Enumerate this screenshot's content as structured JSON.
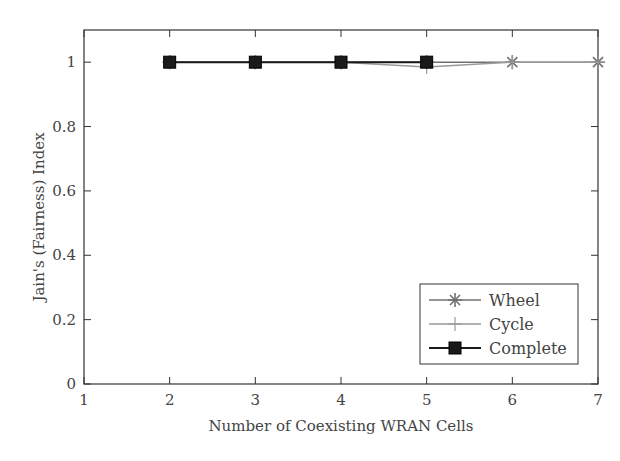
{
  "chart_data": {
    "type": "line",
    "title": "",
    "xlabel": "Number of Coexisting WRAN Cells",
    "ylabel": "Jain's (Fairness) Index",
    "xlim": [
      1,
      7
    ],
    "ylim": [
      0,
      1.1
    ],
    "xticks": [
      1,
      2,
      3,
      4,
      5,
      6,
      7
    ],
    "yticks": [
      0,
      0.2,
      0.4,
      0.6,
      0.8,
      1
    ],
    "ytick_labels": [
      "0",
      "0.2",
      "0.4",
      "0.6",
      "0.8",
      "1"
    ],
    "grid": false,
    "legend_position": "lower right",
    "series": [
      {
        "name": "Wheel",
        "marker": "asterisk",
        "color": "#707070",
        "x": [
          2,
          3,
          4,
          5,
          6,
          7
        ],
        "values": [
          1.0,
          1.0,
          1.0,
          1.0,
          1.0,
          1.0
        ]
      },
      {
        "name": "Cycle",
        "marker": "plus",
        "color": "#9a9a9a",
        "x": [
          2,
          3,
          4,
          5,
          6,
          7
        ],
        "values": [
          1.0,
          1.0,
          1.0,
          0.985,
          1.0,
          1.0
        ]
      },
      {
        "name": "Complete",
        "marker": "square",
        "color": "#1a1a1a",
        "x": [
          2,
          3,
          4,
          5
        ],
        "values": [
          1.0,
          1.0,
          1.0,
          1.0
        ]
      }
    ]
  }
}
